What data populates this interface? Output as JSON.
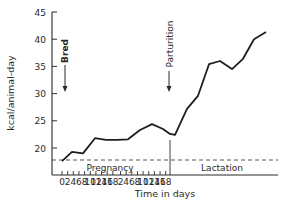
{
  "chart_data": {
    "type": "line",
    "title": "",
    "xlabel": "Time in days",
    "ylabel": "kcal/animal-day",
    "ylim": [
      16.5,
      45
    ],
    "yticks": [
      20,
      25,
      30,
      35,
      40,
      45
    ],
    "grid": false,
    "legend": null,
    "x_tick_labels": [
      "0",
      "2",
      "4",
      "6",
      "8",
      "10",
      "12",
      "14",
      "16",
      "18",
      "2",
      "4",
      "6",
      "8",
      "10",
      "12",
      "14",
      "16",
      "18"
    ],
    "phases": [
      {
        "name": "Pregnancy",
        "days": [
          0,
          2,
          4,
          6,
          8,
          10,
          12,
          14,
          16,
          18
        ]
      },
      {
        "name": "Lactation",
        "days": [
          0,
          2,
          4,
          6,
          8,
          10,
          12,
          14,
          16,
          18
        ]
      }
    ],
    "series": [
      {
        "name": "Energy intake",
        "x": [
          "P0",
          "P2",
          "P4",
          "P6",
          "P8",
          "P10",
          "P12",
          "P14",
          "P16",
          "P18",
          "L0",
          "L2",
          "L4",
          "L6",
          "L8",
          "L10",
          "L12",
          "L14",
          "L16",
          "L18"
        ],
        "values": [
          17.6,
          19.3,
          19.0,
          21.8,
          21.5,
          21.5,
          21.6,
          23.3,
          24.4,
          23.5,
          22.6,
          22.4,
          27.2,
          29.6,
          35.4,
          36.0,
          34.5,
          36.4,
          40.0,
          41.3
        ]
      }
    ],
    "reference_line": {
      "y": 17.6,
      "style": "dashed"
    },
    "annotations": [
      {
        "text": "Bred",
        "at": "Pregnancy day 0",
        "arrow": "down"
      },
      {
        "text": "Parturition",
        "at": "end of pregnancy / start of lactation",
        "arrow": "down"
      }
    ]
  },
  "labels": {
    "ylabel": "kcal/animal-day",
    "xlabel": "Time in days",
    "bred": "Bred",
    "parturition": "Parturition",
    "pregnancy": "Pregnancy",
    "lactation": "Lactation"
  }
}
